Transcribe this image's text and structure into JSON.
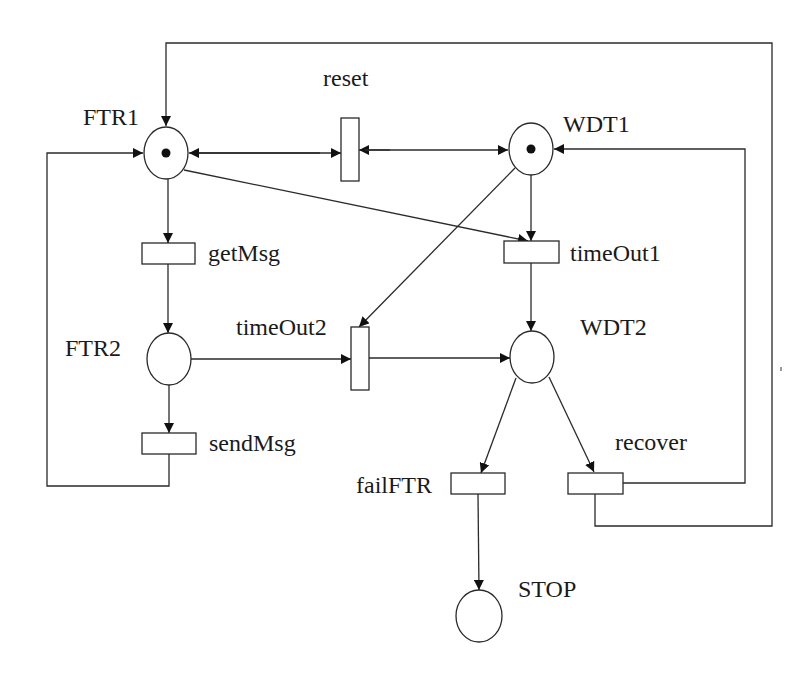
{
  "diagram": {
    "type": "petri-net",
    "colors": {
      "stroke": "#2a2a2a",
      "token": "#111111",
      "background": "#ffffff"
    },
    "places": [
      {
        "id": "FTR1",
        "label": "FTR1",
        "tokens": 1,
        "cx": 166,
        "cy": 153
      },
      {
        "id": "FTR2",
        "label": "FTR2",
        "tokens": 0,
        "cx": 169,
        "cy": 359
      },
      {
        "id": "WDT1",
        "label": "WDT1",
        "tokens": 1,
        "cx": 531,
        "cy": 149
      },
      {
        "id": "WDT2",
        "label": "WDT2",
        "tokens": 0,
        "cx": 532,
        "cy": 357
      },
      {
        "id": "STOP",
        "label": "STOP",
        "tokens": 0,
        "cx": 479,
        "cy": 616
      }
    ],
    "transitions": [
      {
        "id": "reset",
        "label": "reset",
        "orientation": "vertical"
      },
      {
        "id": "getMsg",
        "label": "getMsg",
        "orientation": "horizontal"
      },
      {
        "id": "sendMsg",
        "label": "sendMsg",
        "orientation": "horizontal"
      },
      {
        "id": "timeOut1",
        "label": "timeOut1",
        "orientation": "horizontal"
      },
      {
        "id": "timeOut2",
        "label": "timeOut2",
        "orientation": "vertical"
      },
      {
        "id": "failFTR",
        "label": "failFTR",
        "orientation": "horizontal"
      },
      {
        "id": "recover",
        "label": "recover",
        "orientation": "horizontal"
      }
    ],
    "arcs": [
      {
        "from": "FTR1",
        "to": "getMsg"
      },
      {
        "from": "getMsg",
        "to": "FTR2"
      },
      {
        "from": "FTR2",
        "to": "sendMsg"
      },
      {
        "from": "sendMsg",
        "to": "FTR1"
      },
      {
        "from": "FTR2",
        "to": "timeOut2"
      },
      {
        "from": "WDT1",
        "to": "timeOut2"
      },
      {
        "from": "timeOut2",
        "to": "WDT2"
      },
      {
        "from": "FTR1",
        "to": "timeOut1"
      },
      {
        "from": "WDT1",
        "to": "timeOut1"
      },
      {
        "from": "timeOut1",
        "to": "WDT2"
      },
      {
        "from": "FTR1",
        "to": "reset",
        "bidirectional": true
      },
      {
        "from": "WDT1",
        "to": "reset",
        "bidirectional": true
      },
      {
        "from": "WDT2",
        "to": "failFTR"
      },
      {
        "from": "failFTR",
        "to": "STOP"
      },
      {
        "from": "WDT2",
        "to": "recover"
      },
      {
        "from": "recover",
        "to": "WDT1"
      },
      {
        "from": "recover",
        "to": "FTR1"
      }
    ]
  },
  "labels": {
    "FTR1": "FTR1",
    "FTR2": "FTR2",
    "WDT1": "WDT1",
    "WDT2": "WDT2",
    "STOP": "STOP",
    "reset": "reset",
    "getMsg": "getMsg",
    "sendMsg": "sendMsg",
    "timeOut1": "timeOut1",
    "timeOut2": "timeOut2",
    "failFTR": "failFTR",
    "recover": "recover"
  }
}
